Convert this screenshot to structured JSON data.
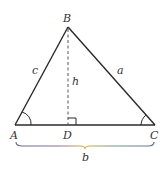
{
  "diagram": {
    "vertices": {
      "A": {
        "label": "A",
        "x": 15,
        "y": 125
      },
      "B": {
        "label": "B",
        "x": 68,
        "y": 27
      },
      "C": {
        "label": "C",
        "x": 155,
        "y": 125
      },
      "D": {
        "label": "D",
        "x": 68,
        "y": 125
      }
    },
    "sides": {
      "c": "c",
      "a": "a",
      "h": "h",
      "b": "b"
    },
    "colors": {
      "line": "#2a2a2a",
      "dashed": "#555555",
      "text": "#333333"
    }
  }
}
